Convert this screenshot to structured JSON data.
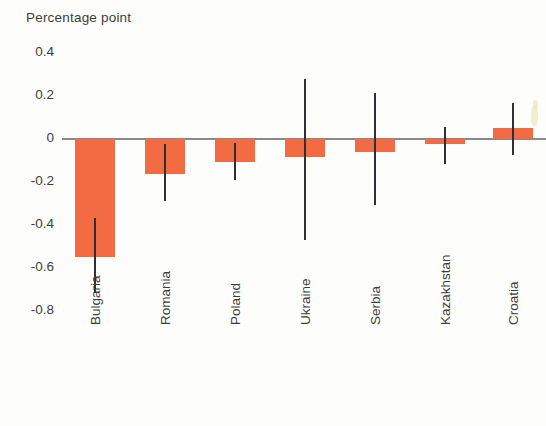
{
  "chart_data": {
    "type": "bar",
    "title": "Percentage point",
    "xlabel": "",
    "ylabel": "Percentage point",
    "ylim": [
      -0.8,
      0.4
    ],
    "yticks": [
      0.4,
      0.2,
      0,
      -0.2,
      -0.4,
      -0.6,
      -0.8
    ],
    "ytick_labels": [
      "0.4",
      "0.2",
      "0",
      "-0.2",
      "-0.4",
      "-0.6",
      "-0.8"
    ],
    "grid": false,
    "legend": "none",
    "categories": [
      "Bulgaria",
      "Romania",
      "Poland",
      "Ukraine",
      "Serbia",
      "Kazakhstan",
      "Croatia"
    ],
    "values": [
      -0.55,
      -0.165,
      -0.105,
      -0.085,
      -0.06,
      -0.025,
      0.05
    ],
    "error_low": [
      -0.72,
      -0.29,
      -0.19,
      -0.47,
      -0.31,
      -0.115,
      -0.075
    ],
    "error_high": [
      -0.37,
      -0.025,
      -0.02,
      0.28,
      0.215,
      0.055,
      0.17
    ],
    "bar_color": "#f26b42",
    "error_color": "#2f2f35",
    "axis_color": "#8a8a8a",
    "series": [
      {
        "name": "Percentage point change",
        "values": [
          -0.55,
          -0.165,
          -0.105,
          -0.085,
          -0.06,
          -0.025,
          0.05
        ]
      }
    ]
  }
}
